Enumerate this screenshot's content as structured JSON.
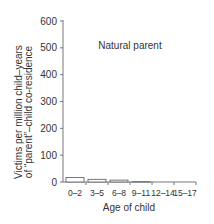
{
  "chart_data": {
    "type": "bar",
    "title": "Natural parent",
    "xlabel": "Age of child",
    "ylabel": [
      "Victims per million child–years",
      "of “parent”–child co-residence"
    ],
    "categories": [
      "0–2",
      "3–5",
      "6–8",
      "9–11",
      "12–14",
      "15–17"
    ],
    "values": [
      17,
      10,
      7,
      1,
      0,
      0
    ],
    "ylim": [
      0,
      600
    ],
    "yticks": [
      0,
      100,
      200,
      300,
      400,
      500,
      600
    ],
    "grid": false,
    "legend": null
  },
  "labels": {
    "annotation": "Natural parent",
    "xlabel": "Age of child",
    "ylabel_line1": "Victims per million child–years",
    "ylabel_line2": "of “parent”–child co-residence",
    "yticks": [
      "600",
      "500",
      "400",
      "300",
      "200",
      "100",
      "0"
    ],
    "xticks": [
      "0–2",
      "3–5",
      "6–8",
      "9–11",
      "12–14",
      "15–17"
    ]
  }
}
